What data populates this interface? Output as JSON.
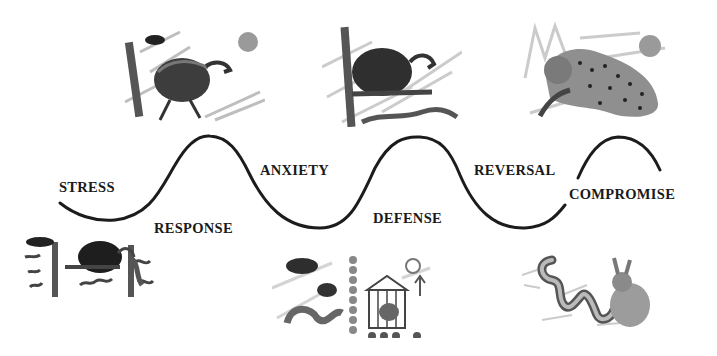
{
  "diagram": {
    "type": "wave-sequence",
    "stages": [
      {
        "id": "stress",
        "label": "STRESS",
        "position": "above-trough"
      },
      {
        "id": "response",
        "label": "RESPONSE",
        "position": "below-peak"
      },
      {
        "id": "anxiety",
        "label": "ANXIETY",
        "position": "above-trough"
      },
      {
        "id": "defense",
        "label": "DEFENSE",
        "position": "below-peak"
      },
      {
        "id": "reversal",
        "label": "REVERSAL",
        "position": "above-trough"
      },
      {
        "id": "compromise",
        "label": "COMPROMISE",
        "position": "on-curve"
      }
    ],
    "illustrations": [
      {
        "id": "top-1",
        "subject": "vulture-perched-with-sun",
        "row": "top"
      },
      {
        "id": "top-2",
        "subject": "vulture-on-branch-with-snake",
        "row": "top"
      },
      {
        "id": "top-3",
        "subject": "leopard-attacking-with-sun",
        "row": "top"
      },
      {
        "id": "bottom-1",
        "subject": "vulture-between-posts-with-snake",
        "row": "bottom"
      },
      {
        "id": "bottom-2",
        "subject": "bird-in-cage-with-snake",
        "row": "bottom"
      },
      {
        "id": "bottom-3",
        "subject": "snake-and-rabbit",
        "row": "bottom"
      }
    ],
    "colors": {
      "curve": "#1c1c1c",
      "text": "#1a1a1a",
      "background": "#ffffff"
    }
  }
}
